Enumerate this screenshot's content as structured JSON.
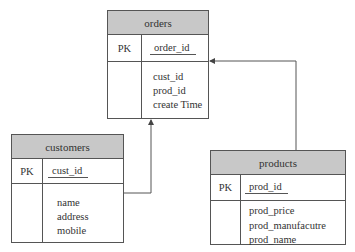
{
  "diagram": {
    "type": "er-diagram",
    "entities": [
      {
        "id": "orders",
        "name": "orders",
        "primary_key_label": "PK",
        "primary_key": "order_id",
        "attributes": [
          "cust_id",
          "prod_id",
          "create Time"
        ]
      },
      {
        "id": "customers",
        "name": "customers",
        "primary_key_label": "PK",
        "primary_key": "cust_id",
        "attributes": [
          "name",
          "address",
          "mobile"
        ]
      },
      {
        "id": "products",
        "name": "products",
        "primary_key_label": "PK",
        "primary_key": "prod_id",
        "attributes": [
          "prod_price",
          "prod_manufacutre",
          "prod_name"
        ]
      }
    ],
    "relationships": [
      {
        "from": "customers",
        "to": "orders",
        "arrow_at": "orders"
      },
      {
        "from": "products",
        "to": "orders",
        "arrow_at": "orders"
      }
    ],
    "colors": {
      "header_fill": "#c8c8c8",
      "border": "#555555",
      "line": "#555555"
    }
  }
}
